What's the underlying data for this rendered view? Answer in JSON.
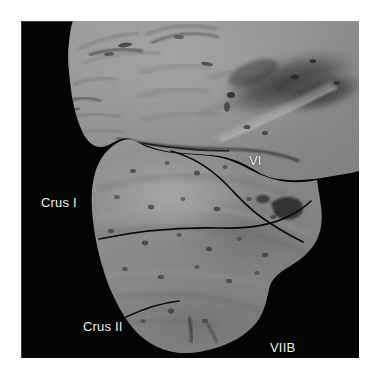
{
  "figure": {
    "kind": "anatomical-photomicrograph",
    "plate_background": "#040404",
    "page_background": "#ffffff",
    "tissue_gray": "#8d8d8d",
    "label_color": "#f2f2f2"
  },
  "labels": {
    "vi": "VI",
    "crus_i": "Crus I",
    "crus_ii": "Crus II",
    "viib": "VIIB"
  },
  "annotations": {
    "traced_fissures": 3,
    "fissure_color": "#0b0b0b"
  }
}
